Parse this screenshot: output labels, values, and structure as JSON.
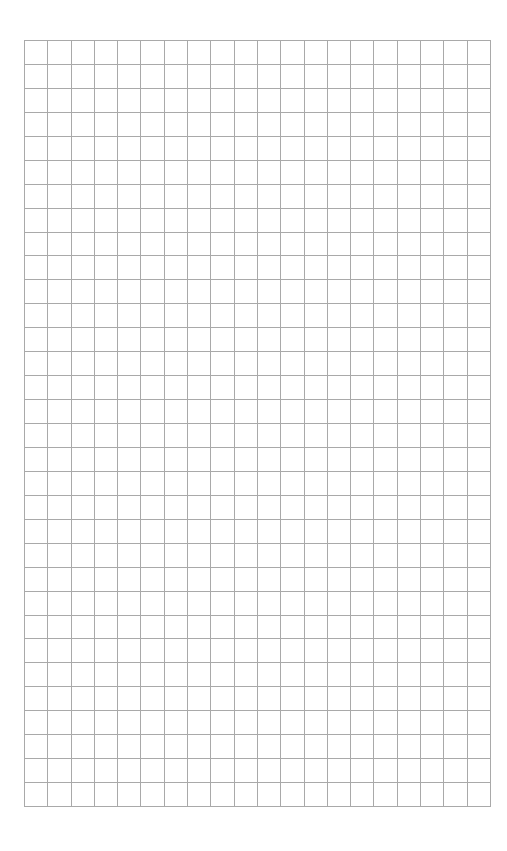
{
  "page": {
    "type": "graph-paper",
    "background_color": "#ffffff"
  },
  "grid": {
    "columns": 20,
    "rows": 32,
    "cell_width": 23.3,
    "cell_height": 23.95,
    "left": 24,
    "top": 40,
    "line_color": "#a9a9a9"
  }
}
